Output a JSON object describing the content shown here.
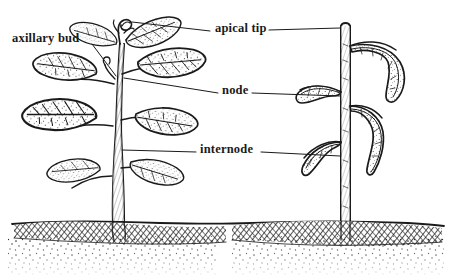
{
  "figure": {
    "background_color": "#ffffff",
    "ink_color": "#1a1a1a",
    "style": "black-and-white pen-and-ink botanical line drawing"
  },
  "labels": [
    {
      "id": "axillary-bud",
      "text": "axillary bud",
      "x": 12,
      "y": 32,
      "leader": "diagonal line down-right to leaf axil on left plant stem"
    },
    {
      "id": "apical-tip",
      "text": "apical tip",
      "x": 215,
      "y": 22,
      "leader": "horizontal lines left to left plant tip and right to right plant cut stem"
    },
    {
      "id": "node",
      "text": "node",
      "x": 222,
      "y": 84,
      "leader": "horizontal lines left to left plant node and right to right plant node"
    },
    {
      "id": "internode",
      "text": "internode",
      "x": 200,
      "y": 143,
      "leader": "horizontal lines left to left plant internode and right to right plant internode"
    }
  ],
  "plants": [
    {
      "id": "left-plant",
      "description": "intact seedling with apical tip, several opposite leaves, axillary buds, thick tapering shaded stem",
      "stem_x": 118,
      "has_apical_tip": true,
      "leaf_count": 7
    },
    {
      "id": "right-plant",
      "description": "decapitated or pruned plant with straight vertical cut stem and fewer drooping leaves, bare lower stem",
      "stem_x": 345,
      "has_apical_tip": false,
      "leaf_count": 4
    }
  ],
  "ground": {
    "description": "soil cross-section with cross-hatched root zone band and stippled subsoil below",
    "surface_y": 222,
    "hatch_band_height": 16,
    "stipple_depth": 45
  }
}
